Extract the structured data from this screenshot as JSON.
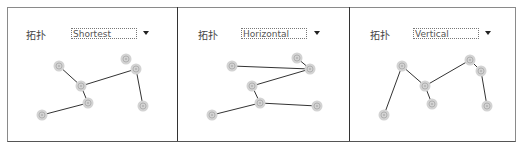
{
  "panels": [
    {
      "label": "拓扑",
      "layout": "Shortest"
    },
    {
      "label": "拓扑",
      "layout": "Horizontal"
    },
    {
      "label": "拓扑",
      "layout": "Vertical"
    }
  ],
  "colors": {
    "node_fill": "#d0d0d0",
    "node_ring": "#b0b0b0",
    "edge": "#333333",
    "border": "#555555"
  }
}
